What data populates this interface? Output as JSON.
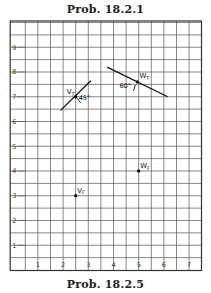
{
  "titles": {
    "top": "Prob. 18.2.1",
    "bottom": "Prob. 18.2.5"
  },
  "grid": {
    "x_labels": [
      "1",
      "2",
      "3",
      "4",
      "5",
      "6",
      "7"
    ],
    "y_labels": [
      "1",
      "2",
      "3",
      "4",
      "5",
      "6",
      "7",
      "8",
      "9"
    ],
    "x_range": [
      -0.1,
      7.5
    ],
    "y_range": [
      -0.5,
      10.0
    ],
    "minor_step": 0.5,
    "line_color": "#555555",
    "frame_color": "#333333"
  },
  "points": [
    {
      "id": "V_T",
      "label": "V",
      "sub": "T",
      "x": 2.5,
      "y": 7.0
    },
    {
      "id": "W_T",
      "label": "W",
      "sub": "T",
      "x": 4.95,
      "y": 7.6
    },
    {
      "id": "V_F",
      "label": "V",
      "sub": "F",
      "x": 2.5,
      "y": 3.0
    },
    {
      "id": "W_F",
      "label": "W",
      "sub": "F",
      "x": 5.0,
      "y": 4.0
    }
  ],
  "lines": [
    {
      "through": "V_T",
      "from": [
        1.9,
        6.45
      ],
      "to": [
        3.1,
        7.65
      ]
    },
    {
      "through": "W_T",
      "from": [
        3.75,
        8.2
      ],
      "to": [
        6.15,
        7.0
      ]
    }
  ],
  "angles": [
    {
      "at": "V_T",
      "label": "45°"
    },
    {
      "at": "W_T",
      "label": "60°"
    }
  ]
}
